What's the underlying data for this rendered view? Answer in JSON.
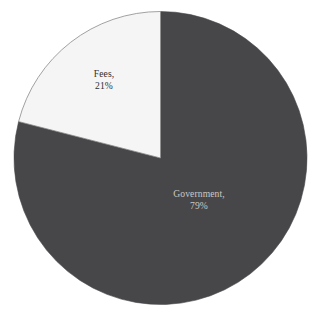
{
  "chart_data": {
    "type": "pie",
    "title": "",
    "subtitle": "",
    "xlabel": "",
    "ylabel": "",
    "legend_position": "none",
    "grid": false,
    "start_angle_deg": 0,
    "direction": "clockwise",
    "categories": [
      "Government",
      "Fees"
    ],
    "values": [
      79,
      21
    ],
    "value_unit": "%",
    "slices": [
      {
        "name": "Government",
        "value": 79,
        "value_label": "79%",
        "name_label": "Government,",
        "color": "#47474a",
        "text_color": "#c9c9c5",
        "sweep_deg": 284.4
      },
      {
        "name": "Fees",
        "value": 21,
        "value_label": "21%",
        "name_label": "Fees,",
        "color": "#f5f5f5",
        "text_color": "#2f2f31",
        "sweep_deg": 75.6
      }
    ]
  },
  "geometry": {
    "center_x": 160.5,
    "center_y": 158,
    "radius": 146.5,
    "outline_color": "#8a8a8a",
    "background": "#ffffff"
  },
  "labels": {
    "government": {
      "name": "Government,",
      "value": "79%"
    },
    "fees": {
      "name": "Fees,",
      "value": "21%"
    }
  }
}
